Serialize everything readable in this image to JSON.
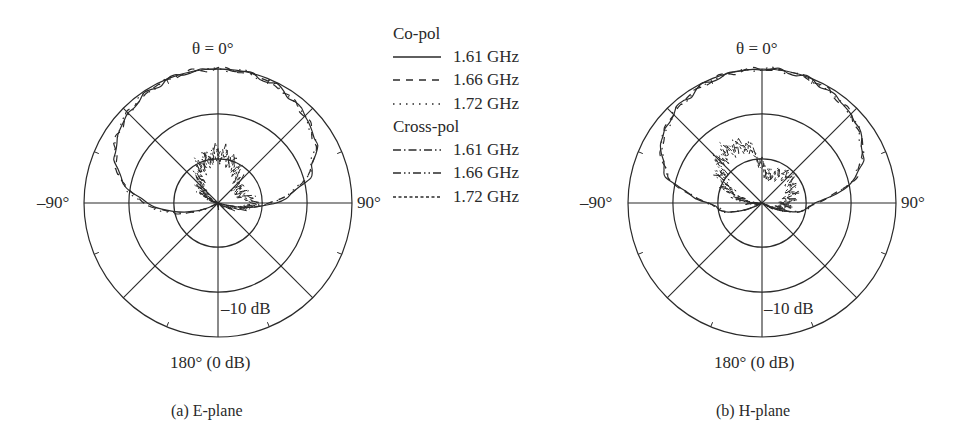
{
  "figure": {
    "legend": {
      "groups": [
        {
          "title": "Co-pol",
          "entries": [
            {
              "label": "1.61 GHz",
              "dash": "",
              "style": "solid"
            },
            {
              "label": "1.66 GHz",
              "dash": "7 6",
              "style": "dashed"
            },
            {
              "label": "1.72 GHz",
              "dash": "1.5 5",
              "style": "dotted"
            }
          ]
        },
        {
          "title": "Cross-pol",
          "entries": [
            {
              "label": "1.61 GHz",
              "dash": "8 3 1.5 3",
              "style": "dash-dot"
            },
            {
              "label": "1.66 GHz",
              "dash": "8 3 1.5 3 1.5 3",
              "style": "dash-dot-dot"
            },
            {
              "label": "1.72 GHz",
              "dash": "3 2.5",
              "style": "short-dash"
            }
          ]
        }
      ]
    },
    "panels": [
      {
        "id": "e-plane",
        "top_label": "θ = 0°",
        "left_label": "–90°",
        "right_label": "90°",
        "ring_label": "–10 dB",
        "bottom_label": "180° (0 dB)",
        "caption": "(a) E-plane"
      },
      {
        "id": "h-plane",
        "top_label": "θ = 0°",
        "left_label": "–90°",
        "right_label": "90°",
        "ring_label": "–10 dB",
        "bottom_label": "180° (0 dB)",
        "caption": "(b) H-plane"
      }
    ]
  },
  "chart_data": [
    {
      "type": "polar-line",
      "title": "(a) E-plane",
      "angle_labels": {
        "0": "θ = 0°",
        "90": "90°",
        "-90": "–90°",
        "180": "180° (0 dB)"
      },
      "radial_rings_dB": [
        0,
        -10,
        -20
      ],
      "radial_label": "–10 dB",
      "spokes_deg": [
        0,
        45,
        90,
        135,
        180,
        225,
        270,
        315
      ],
      "grid": true,
      "legend_position": "right",
      "angles_deg": [
        -180,
        -150,
        -120,
        -105,
        -90,
        -75,
        -60,
        -45,
        -30,
        -15,
        0,
        15,
        30,
        45,
        60,
        75,
        90,
        105,
        120,
        150,
        180
      ],
      "series": [
        {
          "name": "Co-pol 1.61 GHz",
          "dB": [
            -40,
            -38,
            -30,
            -22,
            -14,
            -7,
            -3.5,
            -1.6,
            -0.5,
            0,
            0,
            -0.2,
            -0.9,
            -2.3,
            -4.5,
            -9,
            -17,
            -28,
            -36,
            -40,
            -40
          ]
        },
        {
          "name": "Co-pol 1.66 GHz",
          "dB": [
            -40,
            -38,
            -30,
            -21,
            -13.5,
            -7,
            -3.4,
            -1.5,
            -0.5,
            0,
            0,
            -0.2,
            -1.0,
            -2.4,
            -4.7,
            -9.5,
            -18,
            -28,
            -36,
            -40,
            -40
          ]
        },
        {
          "name": "Co-pol 1.72 GHz",
          "dB": [
            -40,
            -38,
            -29,
            -21,
            -13,
            -6.8,
            -3.3,
            -1.5,
            -0.4,
            0,
            0,
            -0.2,
            -1.0,
            -2.5,
            -4.8,
            -9.8,
            -18,
            -28,
            -36,
            -40,
            -40
          ]
        },
        {
          "name": "Cross-pol 1.61 GHz",
          "dB": [
            -30,
            -31,
            -34,
            -33,
            -32,
            -30,
            -27,
            -25,
            -22,
            -20,
            -19,
            -20,
            -22,
            -24,
            -25,
            -24,
            -22,
            -25,
            -29,
            -32,
            -30
          ]
        },
        {
          "name": "Cross-pol 1.66 GHz",
          "dB": [
            -30,
            -32,
            -34,
            -33,
            -31,
            -29,
            -26,
            -24,
            -21,
            -19,
            -18,
            -19,
            -21,
            -23,
            -24,
            -23,
            -21,
            -24,
            -29,
            -32,
            -30
          ]
        },
        {
          "name": "Cross-pol 1.72 GHz",
          "dB": [
            -31,
            -32,
            -35,
            -34,
            -32,
            -30,
            -27,
            -25,
            -22,
            -20,
            -19.5,
            -20,
            -22,
            -24,
            -25,
            -24,
            -22,
            -25,
            -30,
            -33,
            -31
          ]
        }
      ]
    },
    {
      "type": "polar-line",
      "title": "(b) H-plane",
      "angle_labels": {
        "0": "θ = 0°",
        "90": "90°",
        "-90": "–90°",
        "180": "180° (0 dB)"
      },
      "radial_rings_dB": [
        0,
        -10,
        -20
      ],
      "radial_label": "–10 dB",
      "spokes_deg": [
        0,
        45,
        90,
        135,
        180,
        225,
        270,
        315
      ],
      "grid": true,
      "legend_position": "between panels",
      "angles_deg": [
        -180,
        -150,
        -120,
        -105,
        -90,
        -75,
        -60,
        -45,
        -30,
        -15,
        0,
        15,
        30,
        45,
        60,
        75,
        90,
        105,
        120,
        150,
        180
      ],
      "series": [
        {
          "name": "Co-pol 1.61 GHz",
          "dB": [
            -40,
            -38,
            -30,
            -22,
            -18,
            -8,
            -3.8,
            -1.8,
            -0.7,
            -0.1,
            0,
            -0.1,
            -0.7,
            -1.8,
            -3.8,
            -8,
            -18,
            -22,
            -30,
            -38,
            -40
          ]
        },
        {
          "name": "Co-pol 1.66 GHz",
          "dB": [
            -40,
            -38,
            -30,
            -22,
            -18,
            -8.2,
            -3.9,
            -1.8,
            -0.7,
            -0.1,
            0,
            -0.1,
            -0.7,
            -1.9,
            -3.9,
            -8.2,
            -18,
            -22,
            -30,
            -38,
            -40
          ]
        },
        {
          "name": "Co-pol 1.72 GHz",
          "dB": [
            -40,
            -38,
            -30,
            -22,
            -18,
            -8.4,
            -4,
            -1.9,
            -0.7,
            -0.1,
            0,
            -0.1,
            -0.8,
            -1.9,
            -4,
            -8.4,
            -18,
            -22,
            -30,
            -38,
            -40
          ]
        },
        {
          "name": "Cross-pol 1.61 GHz",
          "dB": [
            -32,
            -33,
            -34,
            -31,
            -28,
            -24,
            -20,
            -17,
            -16,
            -17,
            -22,
            -24,
            -22,
            -21,
            -22,
            -23,
            -24,
            -25,
            -29,
            -33,
            -32
          ]
        },
        {
          "name": "Cross-pol 1.66 GHz",
          "dB": [
            -32,
            -33,
            -34,
            -30,
            -27,
            -23,
            -19,
            -16,
            -15,
            -16,
            -21,
            -23,
            -22,
            -21,
            -22,
            -23,
            -24,
            -25,
            -29,
            -33,
            -32
          ]
        },
        {
          "name": "Cross-pol 1.72 GHz",
          "dB": [
            -33,
            -34,
            -35,
            -31,
            -28,
            -24,
            -20,
            -17,
            -16,
            -17,
            -22,
            -24,
            -23,
            -22,
            -23,
            -24,
            -25,
            -26,
            -30,
            -34,
            -33
          ]
        }
      ]
    }
  ]
}
